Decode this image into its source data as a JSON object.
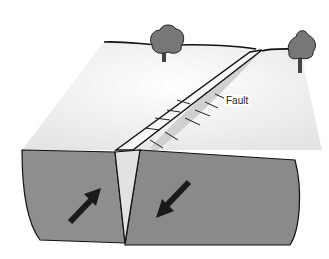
{
  "diagram": {
    "type": "geological-fault-illustration",
    "labels": {
      "fault": "Fault"
    },
    "colors": {
      "ground_surface": "#f2f2f2",
      "cross_section": "#8c8c8c",
      "fault_gap": "#e6e6e6",
      "outline": "#111111",
      "tree": "#6e6e6e",
      "arrow": "#1a1a1a"
    },
    "elements": [
      "left-tree",
      "right-tree",
      "horizon-line",
      "fault-scarp",
      "left-block",
      "right-block",
      "arrow-left-up",
      "arrow-right-down"
    ]
  }
}
